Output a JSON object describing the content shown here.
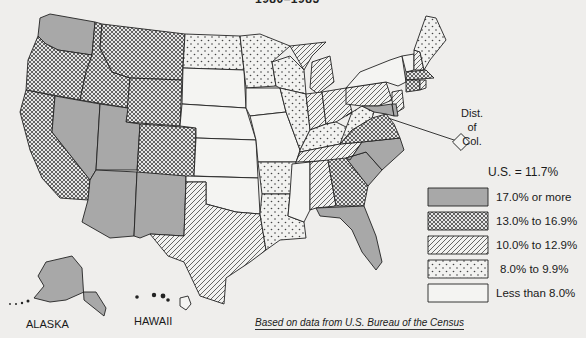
{
  "title": "1980–1985",
  "us_average": "U.S. = 11.7%",
  "dc_label": [
    "Dist.",
    "of",
    "Col."
  ],
  "labels": {
    "alaska": "ALASKA",
    "hawaii": "HAWAII"
  },
  "legend": [
    {
      "key": "gray",
      "label": "17.0% or more",
      "color": "#a8a8a8"
    },
    {
      "key": "cross",
      "label": "13.0% to 16.9%"
    },
    {
      "key": "diag",
      "label": "10.0% to 12.9%"
    },
    {
      "key": "dots",
      "label": "8.0% to 9.9%"
    },
    {
      "key": "blank",
      "label": "Less than 8.0%"
    }
  ],
  "source": "Based on data from U.S. Bureau of the Census",
  "states": {
    "WA": "gray",
    "OR": "cross",
    "CA": "cross",
    "ID": "cross",
    "NV": "gray",
    "MT": "cross",
    "WY": "cross",
    "UT": "gray",
    "AZ": "gray",
    "CO": "cross",
    "NM": "gray",
    "ND": "dots",
    "SD": "blank",
    "NE": "blank",
    "KS": "blank",
    "OK": "blank",
    "TX": "diag",
    "MN": "dots",
    "IA": "blank",
    "MO": "blank",
    "AR": "dots",
    "LA": "dots",
    "WI": "dots",
    "IL": "dots",
    "MI": "diag",
    "IN": "diag",
    "OH": "diag",
    "KY": "dots",
    "TN": "diag",
    "MS": "blank",
    "AL": "diag",
    "GA": "cross",
    "FL": "gray",
    "SC": "gray",
    "NC": "gray",
    "VA": "cross",
    "WV": "dots",
    "PA": "diag",
    "NY": "blank",
    "VT": "blank",
    "NH": "diag",
    "ME": "dots",
    "MA": "cross",
    "CT": "cross",
    "RI": "diag",
    "NJ": "diag",
    "DE": "gray",
    "MD": "gray",
    "DC": "blank",
    "AK": "gray",
    "HI": "gray"
  }
}
